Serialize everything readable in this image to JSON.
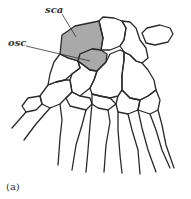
{
  "figure": {
    "panel_label": "(a)",
    "labels": {
      "sca": "sca",
      "osc": "osc"
    },
    "colors": {
      "outline": "#2a2a2a",
      "highlight_fill": "#a9a9a9",
      "background": "#ffffff"
    }
  }
}
